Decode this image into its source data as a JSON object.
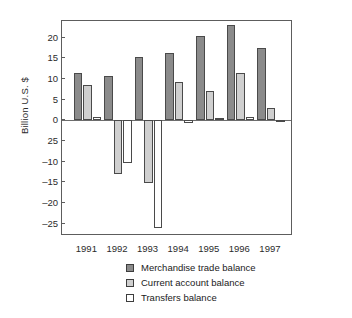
{
  "chart_data": {
    "type": "bar",
    "title": "",
    "xlabel": "",
    "ylabel": "Billion U.S. $",
    "categories": [
      "1991",
      "1992",
      "1993",
      "1994",
      "1995",
      "1996",
      "1997"
    ],
    "ylim": [
      -28,
      24
    ],
    "yticks": [
      20,
      15,
      10,
      5,
      0,
      -5,
      -10,
      -15,
      -20,
      -25
    ],
    "ytick_labels": [
      "20",
      "15",
      "10",
      "5",
      "0",
      "25",
      "–10",
      "–15",
      "–20",
      "–25"
    ],
    "grid": false,
    "legend_position": "bottom-center",
    "series": [
      {
        "name": "Merchandise trade balance",
        "color": "#8b8b8b",
        "values": [
          11.5,
          10.8,
          15.4,
          16.2,
          20.3,
          23.0,
          17.4
        ]
      },
      {
        "name": "Current account balance",
        "color": "#cfcfcf",
        "values": [
          8.5,
          -13.0,
          -15.2,
          9.2,
          7.1,
          11.5,
          2.9
        ]
      },
      {
        "name": "Transfers balance",
        "color": "#ffffff",
        "values": [
          0.8,
          -10.4,
          -26.0,
          -0.6,
          0.5,
          0.9,
          -0.5
        ]
      }
    ]
  }
}
